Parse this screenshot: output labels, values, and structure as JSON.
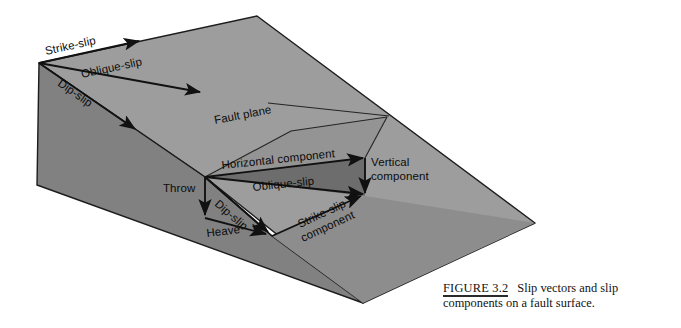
{
  "figure": {
    "number_label": "FIGURE 3.2",
    "caption_text": "Slip vectors and slip components on a fault surface."
  },
  "diagram": {
    "type": "geological-block-diagram",
    "colors": {
      "fault_plane_light": "#9d9d9d",
      "front_face_mid": "#808080",
      "inner_parallelogram_dark": "#6b6b6b",
      "lower_right_face": "#8c8c8c",
      "outline": "#1a1a1a",
      "background": "#ffffff"
    },
    "surfaces": [
      {
        "name": "fault-plane",
        "label": "Fault plane"
      },
      {
        "name": "hanging-wall-front-face",
        "label": ""
      },
      {
        "name": "footwall-lower-face",
        "label": ""
      }
    ],
    "upper_vectors": [
      {
        "name": "strike-slip",
        "label": "Strike-slip"
      },
      {
        "name": "oblique-slip",
        "label": "Oblique-slip"
      },
      {
        "name": "dip-slip",
        "label": "Dip-slip"
      }
    ],
    "component_vectors": [
      {
        "name": "horizontal-component",
        "label": "Horizontal component"
      },
      {
        "name": "vertical-component",
        "label": "Vertical\ncomponent",
        "line1": "Vertical",
        "line2": "component"
      },
      {
        "name": "oblique-slip-component",
        "label": "Oblique-slip"
      },
      {
        "name": "throw",
        "label": "Throw"
      },
      {
        "name": "heave",
        "label": "Heave"
      },
      {
        "name": "dip-slip-component",
        "label": "Dip-slip"
      },
      {
        "name": "strike-slip-component",
        "label": "Strike-slip\ncomponent",
        "line1": "Strike-slip",
        "line2": "component"
      }
    ],
    "labels": {
      "strike_slip": "Strike-slip",
      "oblique_slip": "Oblique-slip",
      "dip_slip": "Dip-slip",
      "fault_plane": "Fault plane",
      "horizontal_component": "Horizontal component",
      "vertical_component_line1": "Vertical",
      "vertical_component_line2": "component",
      "oblique_slip_lower": "Oblique-slip",
      "throw": "Throw",
      "heave": "Heave",
      "dip_slip_lower": "Dip-slip",
      "strike_slip_component_line1": "Strike-slip",
      "strike_slip_component_line2": "component"
    }
  }
}
